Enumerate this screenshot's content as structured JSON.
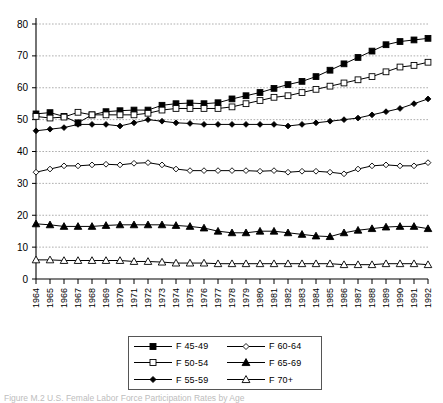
{
  "chart_data": {
    "type": "line",
    "title": "",
    "subtitle": "",
    "xlabel": "",
    "ylabel": "",
    "xlim": [
      1964,
      1992
    ],
    "ylim": [
      0,
      80
    ],
    "y_ticks": [
      0,
      10,
      20,
      30,
      40,
      50,
      60,
      70,
      80
    ],
    "grid": "horizontal-dashed",
    "legend_position": "below-center",
    "x": [
      1964,
      1965,
      1966,
      1967,
      1968,
      1969,
      1970,
      1971,
      1972,
      1973,
      1974,
      1975,
      1976,
      1977,
      1978,
      1979,
      1980,
      1981,
      1982,
      1983,
      1984,
      1985,
      1986,
      1987,
      1988,
      1989,
      1990,
      1991,
      1992
    ],
    "categories": [
      "1964",
      "1965",
      "1966",
      "1967",
      "1968",
      "1969",
      "1970",
      "1971",
      "1972",
      "1973",
      "1974",
      "1975",
      "1976",
      "1977",
      "1978",
      "1979",
      "1980",
      "1981",
      "1982",
      "1983",
      "1984",
      "1985",
      "1986",
      "1987",
      "1988",
      "1989",
      "1990",
      "1991",
      "1992"
    ],
    "series": [
      {
        "name": "F 45-49",
        "marker": "filled-square",
        "values": [
          51.8,
          52.2,
          51.0,
          49.0,
          51.5,
          52.5,
          52.8,
          53.0,
          53.0,
          54.5,
          55.0,
          55.2,
          55.0,
          55.3,
          56.5,
          57.5,
          58.5,
          59.8,
          61.0,
          62.0,
          63.5,
          65.5,
          67.5,
          69.5,
          71.5,
          73.5,
          74.5,
          75.0,
          75.5
        ]
      },
      {
        "name": "F 50-54",
        "marker": "open-square",
        "values": [
          51.0,
          50.5,
          50.8,
          52.3,
          51.5,
          51.5,
          51.5,
          51.5,
          52.0,
          53.0,
          53.5,
          53.5,
          53.5,
          53.5,
          54.0,
          55.0,
          56.0,
          57.0,
          57.5,
          58.5,
          59.5,
          60.5,
          61.5,
          62.5,
          63.5,
          65.0,
          66.5,
          67.0,
          68.0
        ]
      },
      {
        "name": "F 55-59",
        "marker": "filled-diamond",
        "values": [
          46.5,
          47.0,
          47.5,
          48.5,
          48.5,
          48.5,
          48.0,
          49.0,
          50.0,
          49.5,
          49.0,
          48.8,
          48.5,
          48.5,
          48.5,
          48.5,
          48.5,
          48.5,
          48.0,
          48.5,
          49.0,
          49.5,
          50.0,
          50.5,
          51.5,
          52.5,
          53.5,
          55.0,
          56.5
        ]
      },
      {
        "name": "F 60-64",
        "marker": "open-diamond",
        "values": [
          33.5,
          34.5,
          35.5,
          35.5,
          35.8,
          36.0,
          35.8,
          36.3,
          36.5,
          35.8,
          34.5,
          34.0,
          34.0,
          34.0,
          34.0,
          34.0,
          33.8,
          34.0,
          33.5,
          33.8,
          33.8,
          33.5,
          33.0,
          34.5,
          35.5,
          35.8,
          35.5,
          35.5,
          36.5
        ]
      },
      {
        "name": "F 65-69",
        "marker": "filled-triangle",
        "values": [
          17.3,
          17.0,
          16.5,
          16.5,
          16.5,
          16.8,
          17.0,
          17.0,
          17.0,
          17.0,
          16.8,
          16.5,
          16.0,
          15.0,
          14.5,
          14.5,
          15.0,
          15.0,
          14.5,
          14.0,
          13.5,
          13.3,
          14.5,
          15.3,
          15.8,
          16.3,
          16.5,
          16.5,
          15.8
        ]
      },
      {
        "name": "F 70+",
        "marker": "open-triangle",
        "values": [
          6.0,
          6.0,
          5.8,
          5.8,
          5.8,
          5.8,
          5.8,
          5.5,
          5.5,
          5.3,
          5.0,
          5.0,
          5.0,
          4.8,
          4.8,
          4.8,
          4.8,
          4.8,
          4.8,
          4.8,
          4.8,
          4.8,
          4.5,
          4.5,
          4.5,
          4.8,
          4.8,
          4.8,
          4.5
        ]
      }
    ]
  },
  "legend": {
    "items": [
      {
        "label": "F 45-49",
        "marker": "filled-square"
      },
      {
        "label": "F 60-64",
        "marker": "open-diamond"
      },
      {
        "label": "F 50-54",
        "marker": "open-square"
      },
      {
        "label": "F 65-69",
        "marker": "filled-triangle"
      },
      {
        "label": "F 55-59",
        "marker": "filled-diamond"
      },
      {
        "label": "F 70+",
        "marker": "open-triangle"
      }
    ]
  },
  "caption": {
    "prefix": "Figure",
    "text": "Figure M.2 U.S. Female Labor Force Participation Rates by Age"
  },
  "colors": {
    "ink": "#000000",
    "grid": "#999999",
    "background": "#ffffff"
  }
}
